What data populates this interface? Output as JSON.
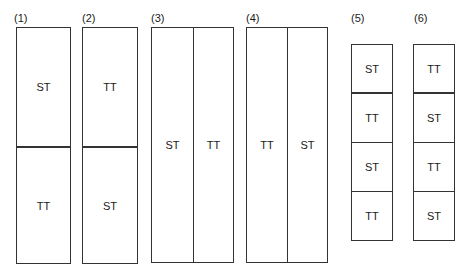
{
  "diagram": {
    "panels": [
      {
        "label": "(1)",
        "layout": "vertical-split",
        "cells": [
          "ST",
          "TT"
        ]
      },
      {
        "label": "(2)",
        "layout": "vertical-split",
        "cells": [
          "TT",
          "ST"
        ]
      },
      {
        "label": "(3)",
        "layout": "horizontal-split",
        "cells": [
          "ST",
          "TT"
        ]
      },
      {
        "label": "(4)",
        "layout": "horizontal-split",
        "cells": [
          "TT",
          "ST"
        ]
      },
      {
        "label": "(5)",
        "layout": "stack-4",
        "cells": [
          "ST",
          "TT",
          "ST",
          "TT"
        ]
      },
      {
        "label": "(6)",
        "layout": "stack-4",
        "cells": [
          "TT",
          "ST",
          "TT",
          "ST"
        ]
      }
    ]
  }
}
